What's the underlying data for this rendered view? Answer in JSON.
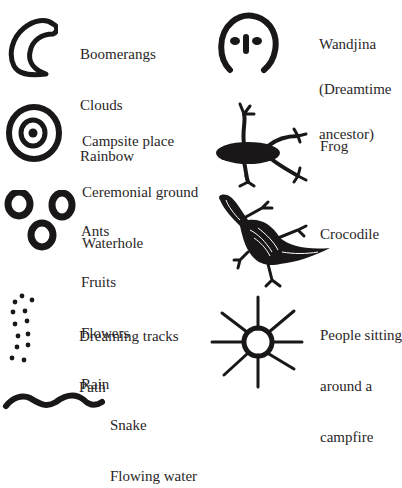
{
  "legend": {
    "items": [
      {
        "id": "boomerang",
        "symbol": "crescent-icon",
        "lines": [
          "Boomerangs",
          "Clouds",
          "Rainbow"
        ]
      },
      {
        "id": "wandjina",
        "symbol": "wandjina-face-icon",
        "lines": [
          "Wandjina",
          "(Dreamtime",
          "ancestor)"
        ]
      },
      {
        "id": "campsite",
        "symbol": "concentric-circles-icon",
        "lines": [
          "Campsite place",
          "Ceremonial ground",
          "Waterhole"
        ]
      },
      {
        "id": "frog",
        "symbol": "frog-icon",
        "lines": [
          "Frog"
        ]
      },
      {
        "id": "ants",
        "symbol": "three-rings-icon",
        "lines": [
          "Ants",
          "Fruits",
          "Flowers",
          "Rain"
        ]
      },
      {
        "id": "crocodile",
        "symbol": "crocodile-icon",
        "lines": [
          "Crocodile"
        ]
      },
      {
        "id": "tracks",
        "symbol": "dotted-tracks-icon",
        "lines": [
          "Dreaming tracks",
          "Path"
        ]
      },
      {
        "id": "campfire",
        "symbol": "campfire-circle-icon",
        "lines": [
          "People sitting",
          "around a",
          "campfire"
        ]
      },
      {
        "id": "snake",
        "symbol": "wavy-line-icon",
        "lines": [
          "Snake",
          "Flowing water"
        ]
      }
    ]
  },
  "colors": {
    "ink": "#1a1718",
    "text": "#2a2627",
    "background": "#ffffff"
  }
}
